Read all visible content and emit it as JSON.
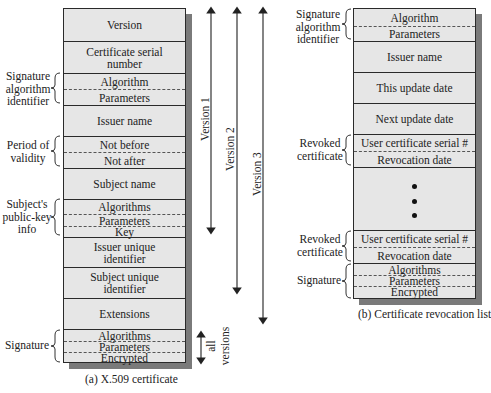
{
  "certificate": {
    "caption": "(a) X.509 certificate",
    "fields": [
      {
        "label": "Version"
      },
      {
        "label": "Certificate serial number"
      },
      {
        "label": "Algorithm"
      },
      {
        "label": "Parameters"
      },
      {
        "label": "Issuer name"
      },
      {
        "label": "Not before"
      },
      {
        "label": "Not after"
      },
      {
        "label": "Subject name"
      },
      {
        "label": "Algorithms"
      },
      {
        "label": "Parameters"
      },
      {
        "label": "Key"
      },
      {
        "label": "Issuer unique identifier"
      },
      {
        "label": "Subject unique identifier"
      },
      {
        "label": "Extensions"
      },
      {
        "label": "Algorithms"
      },
      {
        "label": "Parameters"
      },
      {
        "label": "Encrypted"
      }
    ],
    "groups": [
      {
        "label": "Signature algorithm identifier"
      },
      {
        "label": "Period of validity"
      },
      {
        "label": "Subject's public-key info"
      },
      {
        "label": "Signature"
      }
    ],
    "versions": [
      {
        "label": "Version 1"
      },
      {
        "label": "Version 2"
      },
      {
        "label": "Version 3"
      }
    ],
    "all_versions": {
      "line1": "all",
      "line2": "versions"
    }
  },
  "crl": {
    "caption": "(b) Certificate revocation list",
    "fields": [
      {
        "label": "Algorithm"
      },
      {
        "label": "Parameters"
      },
      {
        "label": "Issuer name"
      },
      {
        "label": "This update date"
      },
      {
        "label": "Next update date"
      },
      {
        "label": "User certificate serial #"
      },
      {
        "label": "Revocation date"
      },
      {
        "label": "•••"
      },
      {
        "label": "User certificate serial #"
      },
      {
        "label": "Revocation date"
      },
      {
        "label": "Algorithms"
      },
      {
        "label": "Parameters"
      },
      {
        "label": "Encrypted"
      }
    ],
    "groups": [
      {
        "label": "Signature algorithm identifier"
      },
      {
        "label": "Revoked certificate"
      },
      {
        "label": "Revoked certificate"
      },
      {
        "label": "Signature"
      }
    ]
  }
}
